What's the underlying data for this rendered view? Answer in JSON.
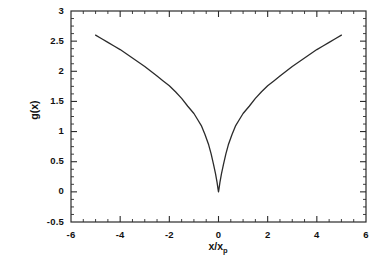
{
  "chart_data": {
    "type": "line",
    "title": "",
    "subtitle": "",
    "xlabel": "x/x",
    "xlabel_subscript": "p",
    "ylabel": "g(x)",
    "xlim": [
      -6,
      6
    ],
    "ylim": [
      -0.5,
      3
    ],
    "xticks": [
      "-6",
      "-4",
      "-2",
      "0",
      "2",
      "4",
      "6"
    ],
    "xtick_values": [
      -6,
      -4,
      -2,
      0,
      2,
      4,
      6
    ],
    "yticks": [
      "3",
      "2.5",
      "2",
      "1.5",
      "1",
      "0.5",
      "0",
      "-0.5"
    ],
    "ytick_values": [
      3,
      2.5,
      2,
      1.5,
      1,
      0.5,
      0,
      -0.5
    ],
    "xminor_step": 0.5,
    "yminor_step": 0.125,
    "grid": false,
    "legend": null,
    "legend_position": "none",
    "line_color": "#2b2b2b",
    "frame_color": "#2b2b2b",
    "background": "#ffffff",
    "series": [
      {
        "name": "g(x)",
        "x": [
          -5,
          -4.75,
          -4.5,
          -4.25,
          -4,
          -3.75,
          -3.5,
          -3.25,
          -3,
          -2.75,
          -2.5,
          -2.25,
          -2,
          -1.75,
          -1.5,
          -1.25,
          -1,
          -0.85,
          -0.7,
          -0.55,
          -0.4,
          -0.3,
          -0.2,
          -0.12,
          -0.06,
          -0.02,
          0,
          0.02,
          0.06,
          0.12,
          0.2,
          0.3,
          0.4,
          0.55,
          0.7,
          0.85,
          1,
          1.25,
          1.5,
          1.75,
          2,
          2.25,
          2.5,
          2.75,
          3,
          3.25,
          3.5,
          3.75,
          4,
          4.25,
          4.5,
          4.75,
          5
        ],
        "y": [
          2.6,
          2.54,
          2.48,
          2.42,
          2.36,
          2.29,
          2.22,
          2.15,
          2.08,
          2.0,
          1.92,
          1.84,
          1.76,
          1.66,
          1.55,
          1.42,
          1.3,
          1.2,
          1.1,
          0.95,
          0.78,
          0.63,
          0.45,
          0.3,
          0.16,
          0.05,
          0.0,
          0.05,
          0.16,
          0.3,
          0.45,
          0.63,
          0.78,
          0.95,
          1.1,
          1.2,
          1.3,
          1.42,
          1.55,
          1.66,
          1.76,
          1.84,
          1.92,
          2.0,
          2.08,
          2.15,
          2.22,
          2.29,
          2.36,
          2.42,
          2.48,
          2.54,
          2.6
        ],
        "description": "symmetric cusped curve, minimum value 0 at x=0, rising to 2.6 at x=+/-5"
      }
    ]
  }
}
